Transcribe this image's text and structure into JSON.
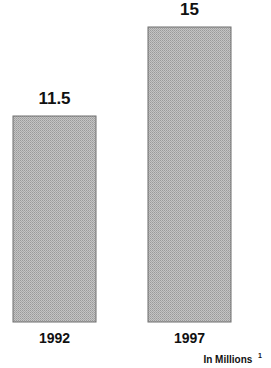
{
  "chart_data": {
    "type": "bar",
    "title": "",
    "categories": [
      "1992",
      "1997"
    ],
    "values": [
      11.5,
      15
    ],
    "value_labels": [
      "11.5",
      "15"
    ],
    "xlabel": "",
    "ylabel": "",
    "units_note": "In Millions",
    "units_note_footnote": "1",
    "ylim": [
      3.4,
      15
    ],
    "grid": false,
    "legend": "none",
    "bar_color": "#b8b8b8",
    "bar_border_color": "#6e6e6e"
  }
}
